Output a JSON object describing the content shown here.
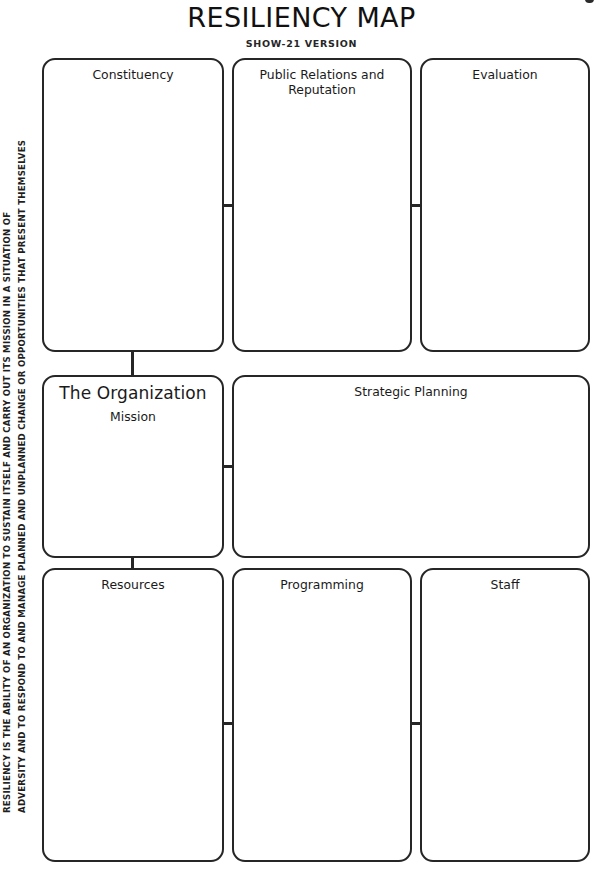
{
  "header": {
    "title": "RESILIENCY MAP",
    "subtitle": "SHOW-21 VERSION"
  },
  "definition": {
    "line1": "RESILIENCY IS THE ABILITY OF AN ORGANIZATION  TO SUSTAIN ITSELF AND CARRY OUT ITS MISSION IN A SITUATION OF",
    "line2": "ADVERSITY AND TO RESPOND TO AND MANAGE PLANNED AND UNPLANNED CHANGE OR OPPORTUNITIES THAT PRESENT THEMSELVES"
  },
  "boxes": {
    "constituency": "Constituency",
    "public_relations": "Public Relations and\nReputation",
    "evaluation": "Evaluation",
    "organization": "The Organization",
    "mission": "Mission",
    "strategic_planning": "Strategic Planning",
    "resources": "Resources",
    "programming": "Programming",
    "staff": "Staff"
  },
  "colors": {
    "border": "#262626",
    "text": "#1a1a1a",
    "background": "#ffffff"
  }
}
